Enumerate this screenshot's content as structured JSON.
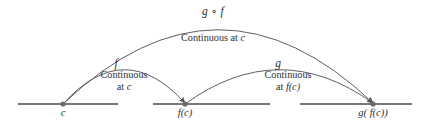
{
  "diagram": {
    "colors": {
      "stroke": "#55555c",
      "axis": "#4a4a52",
      "text": "#2e2e33",
      "point_fill": "#6a6a72",
      "background": "#ffffff"
    },
    "axis": {
      "y": 104,
      "segments": [
        {
          "x1": 18,
          "x2": 118
        },
        {
          "x1": 153,
          "x2": 270
        },
        {
          "x1": 300,
          "x2": 412
        }
      ]
    },
    "points": [
      {
        "id": "c",
        "label": "c",
        "x": 63,
        "y": 104,
        "label_x": 63,
        "label_y": 107
      },
      {
        "id": "fc",
        "label": "f(c)",
        "x": 185,
        "y": 104,
        "label_x": 185,
        "label_y": 107
      },
      {
        "id": "gfc",
        "label": "g( f(c))",
        "x": 373,
        "y": 104,
        "label_x": 373,
        "label_y": 107
      }
    ],
    "arcs": [
      {
        "id": "arc-f",
        "from": "c",
        "to": "fc",
        "name": "f",
        "caption_line1": "Continuous",
        "caption_line2": "at c",
        "apex_y": 70,
        "name_x": 116,
        "name_y": 57,
        "caption_x": 124,
        "caption_y": 69
      },
      {
        "id": "arc-g",
        "from": "fc",
        "to": "gfc",
        "name": "g",
        "caption_line1": "Continuous",
        "caption_line2": "at f(c)",
        "apex_y": 70,
        "name_x": 278,
        "name_y": 57,
        "caption_x": 288,
        "caption_y": 69
      },
      {
        "id": "arc-composite",
        "from": "c",
        "to": "gfc",
        "name": "g ∘ f",
        "caption_line1": "Continuous at c",
        "caption_line2": "",
        "apex_y": 30,
        "name_x": 213,
        "name_y": 5,
        "caption_x": 213,
        "caption_y": 32
      }
    ]
  }
}
